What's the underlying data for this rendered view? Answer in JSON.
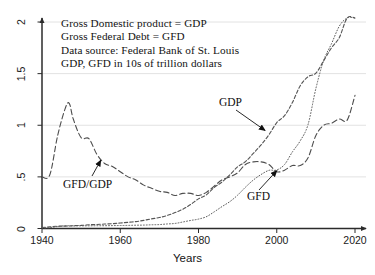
{
  "chart_data": {
    "type": "line",
    "title": "",
    "xlabel": "Years",
    "ylabel": "",
    "xlim": [
      1938,
      2021
    ],
    "ylim": [
      0,
      2.08
    ],
    "xticks": [
      1940,
      1960,
      1980,
      2000,
      2020
    ],
    "xtick_labels": [
      "1940",
      "1960",
      "1980",
      "2000",
      "2020"
    ],
    "yticks": [
      0,
      0.5,
      1,
      1.5,
      2
    ],
    "ytick_labels": [
      "0",
      ".5",
      "1",
      "1.5",
      "2"
    ],
    "grid": true,
    "grid_axis": "y",
    "legend_position": "none",
    "annotations": [
      "Gross Domestic product = GDP",
      "Gross Federal Debt = GFD",
      "Data source: Federal Bank of St. Louis",
      "GDP, GFD in 10s of trillion dollars"
    ],
    "series": [
      {
        "name": "GDP",
        "label": "GDP",
        "style": "dashed",
        "color": "#555555",
        "x": [
          1940,
          1942,
          1944,
          1946,
          1948,
          1950,
          1952,
          1954,
          1956,
          1958,
          1960,
          1962,
          1964,
          1966,
          1968,
          1970,
          1972,
          1974,
          1976,
          1978,
          1980,
          1982,
          1984,
          1986,
          1988,
          1990,
          1992,
          1994,
          1996,
          1998,
          2000,
          2002,
          2004,
          2006,
          2008,
          2010,
          2012,
          2014,
          2016,
          2018,
          2020
        ],
        "y": [
          0.01,
          0.016,
          0.022,
          0.023,
          0.027,
          0.03,
          0.036,
          0.039,
          0.043,
          0.047,
          0.053,
          0.06,
          0.067,
          0.079,
          0.093,
          0.106,
          0.126,
          0.154,
          0.187,
          0.233,
          0.287,
          0.326,
          0.397,
          0.45,
          0.52,
          0.597,
          0.648,
          0.727,
          0.81,
          0.908,
          1.025,
          1.093,
          1.22,
          1.383,
          1.47,
          1.504,
          1.625,
          1.75,
          1.85,
          2.06,
          2.09
        ]
      },
      {
        "name": "GFD",
        "label": "GFD",
        "style": "dotted",
        "color": "#5a5a5a",
        "x": [
          1940,
          1942,
          1944,
          1946,
          1948,
          1950,
          1952,
          1954,
          1956,
          1958,
          1960,
          1962,
          1964,
          1966,
          1968,
          1970,
          1972,
          1974,
          1976,
          1978,
          1980,
          1982,
          1984,
          1986,
          1988,
          1990,
          1992,
          1994,
          1996,
          1998,
          2000,
          2002,
          2004,
          2006,
          2008,
          2010,
          2012,
          2014,
          2016,
          2018,
          2020
        ],
        "y": [
          0.005,
          0.008,
          0.02,
          0.027,
          0.025,
          0.026,
          0.026,
          0.027,
          0.027,
          0.028,
          0.029,
          0.03,
          0.032,
          0.033,
          0.036,
          0.038,
          0.044,
          0.049,
          0.063,
          0.078,
          0.091,
          0.114,
          0.161,
          0.212,
          0.26,
          0.323,
          0.4,
          0.469,
          0.523,
          0.563,
          0.567,
          0.62,
          0.742,
          0.849,
          1.007,
          1.356,
          1.628,
          1.79,
          1.96,
          2.16,
          2.7
        ]
      },
      {
        "name": "GFD/GDP",
        "label": "GFD/GDP",
        "style": "longdash",
        "color": "#4d4d4d",
        "x": [
          1940,
          1942,
          1944,
          1946,
          1947,
          1948,
          1950,
          1952,
          1954,
          1956,
          1958,
          1960,
          1962,
          1964,
          1966,
          1968,
          1970,
          1972,
          1974,
          1976,
          1978,
          1980,
          1982,
          1984,
          1986,
          1988,
          1990,
          1992,
          1994,
          1996,
          1998,
          2000,
          2002,
          2004,
          2006,
          2008,
          2010,
          2012,
          2014,
          2016,
          2018,
          2020
        ],
        "y": [
          0.5,
          0.52,
          0.9,
          1.17,
          1.21,
          1.06,
          0.88,
          0.87,
          0.72,
          0.63,
          0.6,
          0.55,
          0.5,
          0.47,
          0.42,
          0.39,
          0.36,
          0.35,
          0.32,
          0.34,
          0.34,
          0.32,
          0.35,
          0.41,
          0.47,
          0.5,
          0.54,
          0.62,
          0.645,
          0.645,
          0.62,
          0.55,
          0.565,
          0.61,
          0.61,
          0.685,
          0.9,
          1.0,
          1.02,
          1.06,
          1.05,
          1.29
        ]
      }
    ],
    "callouts": [
      {
        "label": "GDP",
        "target_series": "GDP",
        "target_x": 1997,
        "target_y": 0.95
      },
      {
        "label": "GFD",
        "target_series": "GFD",
        "target_x": 2000,
        "target_y": 0.56
      },
      {
        "label": "GFD/GDP",
        "target_series": "GFD/GDP",
        "target_x": 1955,
        "target_y": 0.66
      }
    ]
  },
  "axis": {
    "x_title": "Years",
    "x_labels": [
      "1940",
      "1960",
      "1980",
      "2000",
      "2020"
    ],
    "y_labels": [
      "0",
      ".5",
      "1",
      "1.5",
      "2"
    ]
  },
  "notes": {
    "line1": "Gross Domestic product = GDP",
    "line2": "Gross Federal Debt = GFD",
    "line3": "Data source: Federal Bank of St. Louis",
    "line4": "GDP, GFD in 10s of trillion dollars"
  },
  "labels": {
    "gdp": "GDP",
    "gfd": "GFD",
    "ratio": "GFD/GDP"
  }
}
